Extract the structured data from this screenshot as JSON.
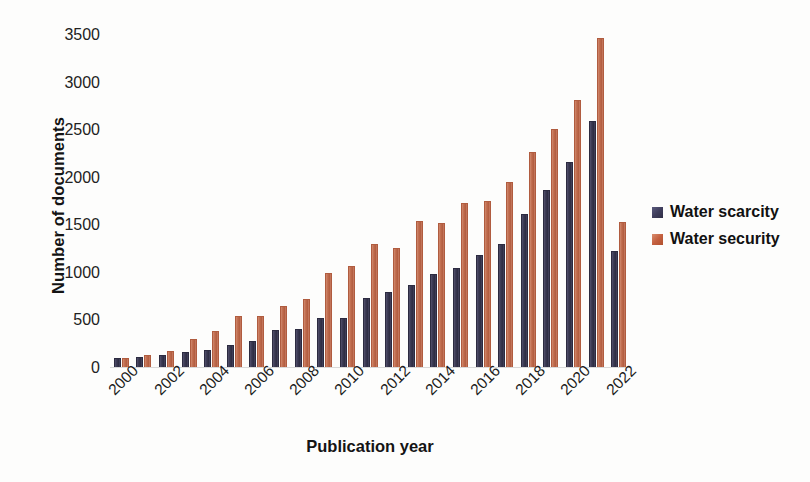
{
  "chart_data": {
    "type": "bar",
    "title": "",
    "subtitle": "",
    "xlabel": "Publication year",
    "ylabel": "Number of documents",
    "categories": [
      "2000",
      "2001",
      "2002",
      "2003",
      "2004",
      "2005",
      "2006",
      "2007",
      "2008",
      "2009",
      "2010",
      "2011",
      "2012",
      "2013",
      "2014",
      "2015",
      "2016",
      "2017",
      "2018",
      "2019",
      "2020",
      "2021",
      "2022"
    ],
    "x_tick_labels": [
      "2000",
      "2002",
      "2004",
      "2006",
      "2008",
      "2010",
      "2012",
      "2014",
      "2016",
      "2018",
      "2020",
      "2022"
    ],
    "y_tick_labels": [
      "0",
      "500",
      "1000",
      "1500",
      "2000",
      "2500",
      "3000",
      "3500"
    ],
    "y_ticks": [
      0,
      500,
      1000,
      1500,
      2000,
      2500,
      3000,
      3500
    ],
    "ylim": [
      0,
      3500
    ],
    "grid": false,
    "legend_position": "right",
    "series": [
      {
        "name": "Water scarcity",
        "color": "#3a3952",
        "values": [
          110,
          120,
          140,
          170,
          185,
          240,
          285,
          400,
          405,
          530,
          530,
          735,
          800,
          875,
          985,
          1055,
          1185,
          1300,
          1620,
          1875,
          2165,
          2600,
          1230
        ]
      },
      {
        "name": "Water security",
        "color": "#c06c4e",
        "values": [
          110,
          135,
          180,
          300,
          390,
          545,
          550,
          650,
          725,
          1000,
          1070,
          1305,
          1260,
          1540,
          1520,
          1730,
          1755,
          1955,
          2270,
          2510,
          2820,
          3470,
          1530
        ]
      }
    ]
  },
  "legend": {
    "entries": [
      {
        "label": "Water scarcity",
        "color": "#3a3952"
      },
      {
        "label": "Water security",
        "color": "#c06c4e"
      }
    ]
  }
}
